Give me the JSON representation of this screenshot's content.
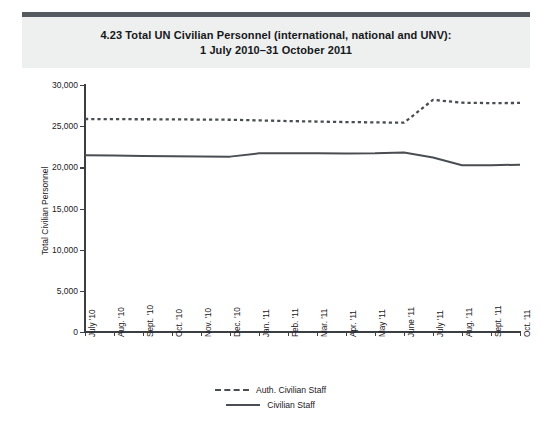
{
  "header": {
    "number": "4.23",
    "title_line1": "4.23  Total UN Civilian Personnel (international, national and UNV):",
    "title_line2": "1 July 2010–31 October 2011"
  },
  "legend": {
    "position": "bottom-center",
    "items": [
      {
        "label": "Auth. Civilian Staff",
        "style": "dashed",
        "color": "#4a4e52"
      },
      {
        "label": "Civilian Staff",
        "style": "solid",
        "color": "#4a4e52"
      }
    ]
  },
  "chart_data": {
    "type": "line",
    "title": "4.23  Total UN Civilian Personnel (international, national and UNV): 1 July 2010–31 October 2011",
    "xlabel": "",
    "ylabel": "Total Civilian Personnel",
    "ylim": [
      0,
      30000
    ],
    "yticks": [
      0,
      5000,
      10000,
      15000,
      20000,
      25000,
      30000
    ],
    "ytick_labels": [
      "0",
      "5,000",
      "10,000",
      "15,000",
      "20,000",
      "25,000",
      "30,000"
    ],
    "grid": false,
    "categories": [
      "July '10",
      "Aug. '10",
      "Sept. '10",
      "Oct. '10",
      "Nov. '10",
      "Dec. '10",
      "Jan. '11",
      "Feb. '11",
      "Mar. '11",
      "Apr. '11",
      "May '11",
      "June '11",
      "July '11",
      "Aug. '11",
      "Sept. '11",
      "Oct. '11"
    ],
    "series": [
      {
        "name": "Auth. Civilian Staff",
        "style": "dashed",
        "color": "#4a4e52",
        "values": [
          25870,
          25850,
          25840,
          25830,
          25800,
          25780,
          25700,
          25620,
          25560,
          25500,
          25460,
          25420,
          28200,
          27850,
          27800,
          27820
        ]
      },
      {
        "name": "Civilian Staff",
        "style": "solid",
        "color": "#4a4e52",
        "values": [
          21480,
          21430,
          21390,
          21350,
          21320,
          21300,
          21700,
          21720,
          21700,
          21690,
          21700,
          21800,
          21200,
          20250,
          20260,
          20320
        ]
      }
    ]
  }
}
